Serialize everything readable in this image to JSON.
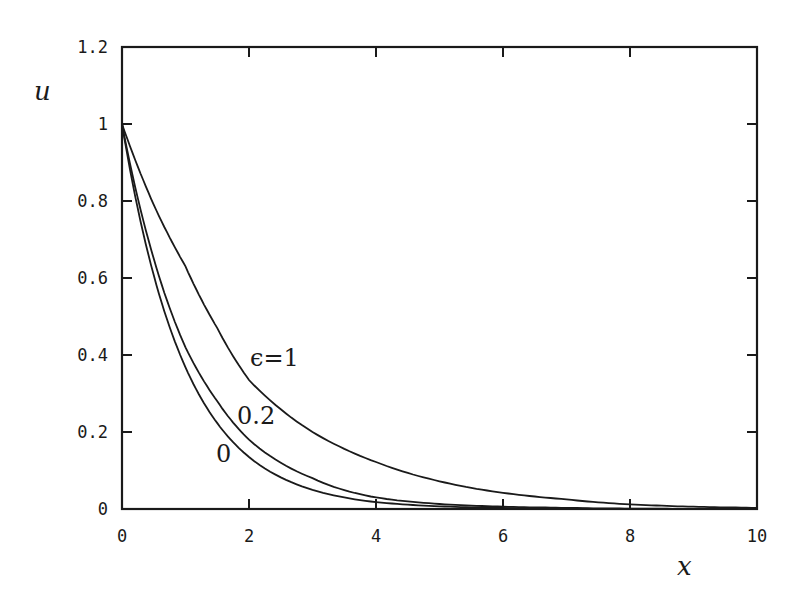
{
  "chart_data": {
    "type": "line",
    "title": "",
    "xlabel": "x",
    "ylabel": "u",
    "xlim": [
      0,
      10
    ],
    "ylim": [
      0,
      1.2
    ],
    "grid": false,
    "legend": "none (curves labeled inline)",
    "x_ticks": [
      "0",
      "2",
      "4",
      "6",
      "8",
      "10"
    ],
    "y_ticks": [
      "0",
      "0.2",
      "0.4",
      "0.6",
      "0.8",
      "1",
      "1.2"
    ],
    "x": [
      0,
      0.5,
      1,
      1.5,
      2,
      3,
      4,
      5,
      6,
      7,
      8,
      9,
      10
    ],
    "series": [
      {
        "name": "ε=1",
        "label": "ϵ=1",
        "values": [
          1.0,
          0.79,
          0.63,
          0.47,
          0.335,
          0.2,
          0.122,
          0.072,
          0.042,
          0.025,
          0.012,
          0.006,
          0.003
        ]
      },
      {
        "name": "ε=0.2",
        "label": "0.2",
        "values": [
          1.0,
          0.65,
          0.42,
          0.28,
          0.18,
          0.08,
          0.03,
          0.013,
          0.006,
          0.003,
          0.001,
          0.0005,
          0.0002
        ]
      },
      {
        "name": "ε=0",
        "label": "0",
        "values": [
          1.0,
          0.607,
          0.368,
          0.223,
          0.135,
          0.05,
          0.018,
          0.007,
          0.0025,
          0.0009,
          0.0003,
          0.0001,
          5e-05
        ]
      }
    ]
  },
  "labels": {
    "xlabel": "x",
    "ylabel": "u",
    "curve_eps1": "ϵ=1",
    "curve_eps02": "0.2",
    "curve_eps0": "0"
  }
}
